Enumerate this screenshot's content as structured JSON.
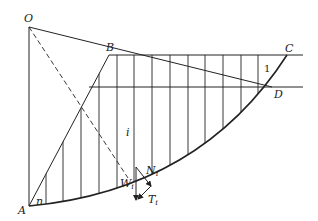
{
  "diagram": {
    "type": "slope-stability-method-of-slices",
    "labels": {
      "O": "O",
      "A": "A",
      "B": "B",
      "C": "C",
      "D": "D",
      "slice_first": "1",
      "slice_i": "i",
      "slice_n": "n",
      "W": "W",
      "W_sub": "i",
      "N": "N",
      "N_sub": "i",
      "T": "T",
      "T_sub": "i"
    },
    "points": {
      "O": [
        29,
        27
      ],
      "A": [
        29,
        206
      ],
      "B": [
        109,
        55
      ],
      "C": [
        287,
        55
      ],
      "D": [
        272,
        87
      ]
    },
    "slice_x": [
      46,
      63,
      81,
      99,
      117,
      134,
      152,
      170,
      188,
      205,
      223,
      241,
      258,
      272
    ],
    "colors": {
      "line": "#222222",
      "background": "#ffffff"
    }
  }
}
